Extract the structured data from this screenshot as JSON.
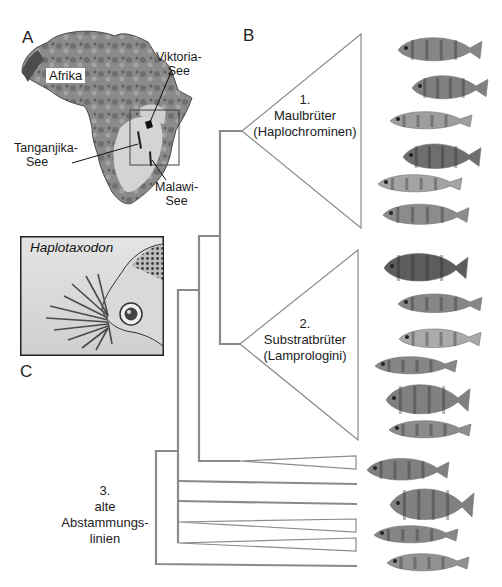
{
  "panels": {
    "a": {
      "letter": "A",
      "continent_label": "Afrika",
      "lakes": [
        {
          "line1": "Viktoria-",
          "line2": "See"
        },
        {
          "line1": "Tanganjika-",
          "line2": "See"
        },
        {
          "line1": "Malawi-",
          "line2": "See"
        }
      ]
    },
    "b": {
      "letter": "B",
      "clades": [
        {
          "number": "1.",
          "name": "Maulbrüter",
          "group": "(Haplochrominen)"
        },
        {
          "number": "2.",
          "name": "Substratbrüter",
          "group": "(Lamprologini)"
        },
        {
          "number": "3.",
          "name_line1": "alte",
          "name_line2": "Abstammungs-",
          "name_line3": "linien"
        }
      ]
    },
    "c": {
      "letter": "C",
      "species": "Haplotaxodon"
    }
  },
  "colors": {
    "tree_line": "#8a8a8a",
    "map_dark": "#555555",
    "map_mid": "#8c8c8c",
    "map_light": "#d8d8d8",
    "fish": "#6e6e6e"
  }
}
